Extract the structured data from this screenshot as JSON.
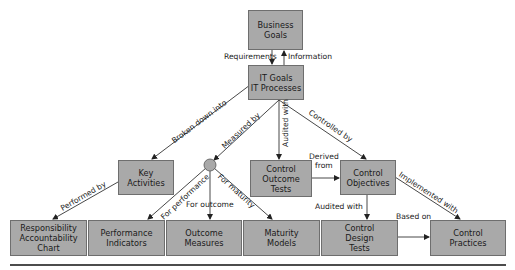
{
  "diagram": {
    "nodes": {
      "business_goals": "Business\nGoals",
      "it_goals": "IT Goals\nIT Processes",
      "key_activities": "Key\nActivities",
      "control_outcome_tests": "Control\nOutcome\nTests",
      "control_objectives": "Control\nObjectives",
      "raci_chart": "Responsibility\nAccountability\nChart",
      "performance_indicators": "Performance\nIndicators",
      "outcome_measures": "Outcome\nMeasures",
      "maturity_models": "Maturity\nModels",
      "control_design_tests": "Control\nDesign\nTests",
      "control_practices": "Control\nPractices"
    },
    "edges": {
      "requirements": "Requirements",
      "information": "Information",
      "broken_down_into": "Broken down into",
      "measured_by": "Measured by",
      "audited_with_1": "Audited with",
      "controlled_by": "Controlled by",
      "derived_from": "Derived\nfrom",
      "performed_by": "Performed by",
      "for_performance": "For performance",
      "for_outcome": "For outcome",
      "for_maturity": "For maturity",
      "implemented_with": "Implemented with",
      "audited_with_2": "Audited with",
      "based_on": "Based on"
    },
    "colors": {
      "box_fill": "#a9a9a9",
      "box_border": "#6e6e6e",
      "line": "#333333"
    }
  }
}
